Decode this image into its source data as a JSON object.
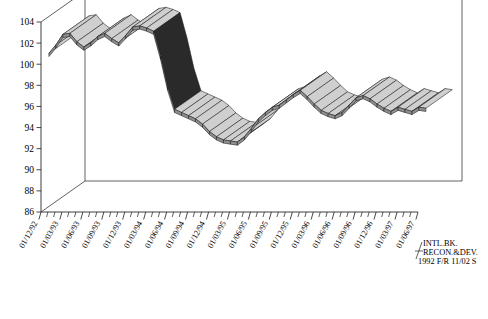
{
  "chart_data": {
    "type": "area",
    "title": "",
    "subtitle": "",
    "xlabel": "",
    "ylabel": "",
    "ylim": [
      86,
      104
    ],
    "ytick_step": 2,
    "grid": false,
    "legend_position": "bottom-right",
    "style": "3d-ribbon",
    "ytick_labels": [
      "104",
      "102",
      "100",
      "98",
      "96",
      "94",
      "92",
      "90",
      "88",
      "86"
    ],
    "ytick_values": [
      104,
      102,
      100,
      98,
      96,
      94,
      92,
      90,
      88,
      86
    ],
    "categories": [
      "01/12/92",
      "01/03/93",
      "01/06/93",
      "01/09/93",
      "01/12/93",
      "01/03/94",
      "01/06/94",
      "01/09/94",
      "01/12/94",
      "01/03/95",
      "01/06/95",
      "01/09/95",
      "01/12/95",
      "01/03/96",
      "01/06/96",
      "01/09/96",
      "01/12/96",
      "01/03/97",
      "01/06/97"
    ],
    "x_minor_ticks_per_category": 3,
    "series": [
      {
        "name": "INTL.BK. RECON.&DEV. 1992 F/R 11/02 S",
        "color": "#cfcfcf",
        "x": [
          "01/12/92",
          "01/01/93",
          "01/02/93",
          "01/03/93",
          "01/04/93",
          "01/05/93",
          "01/06/93",
          "01/07/93",
          "01/08/93",
          "01/09/93",
          "01/10/93",
          "01/11/93",
          "01/12/93",
          "01/01/94",
          "01/02/94",
          "01/03/94",
          "01/04/94",
          "01/05/94",
          "01/06/94",
          "01/07/94",
          "01/08/94",
          "01/09/94",
          "01/10/94",
          "01/11/94",
          "01/12/94",
          "01/01/95",
          "01/02/95",
          "01/03/95",
          "01/04/95",
          "01/05/95",
          "01/06/95",
          "01/07/95",
          "01/08/95",
          "01/09/95",
          "01/10/95",
          "01/11/95",
          "01/12/95",
          "01/01/96",
          "01/02/96",
          "01/03/96",
          "01/04/96",
          "01/05/96",
          "01/06/96",
          "01/07/96",
          "01/08/96",
          "01/09/96",
          "01/10/96",
          "01/11/96",
          "01/12/96",
          "01/01/97",
          "01/02/97",
          "01/03/97",
          "01/04/97",
          "01/05/97",
          "01/06/97"
        ],
        "values": [
          100.5,
          101.3,
          102.3,
          102.4,
          101.6,
          101.1,
          101.5,
          102.1,
          102.4,
          101.9,
          101.5,
          102.2,
          103.0,
          103.1,
          102.9,
          102.6,
          100.2,
          97.3,
          95.2,
          94.9,
          94.6,
          94.3,
          93.8,
          93.1,
          92.6,
          92.3,
          92.2,
          92.1,
          92.6,
          93.4,
          94.3,
          94.9,
          95.4,
          95.6,
          96.1,
          96.6,
          97.0,
          96.4,
          95.7,
          95.1,
          94.8,
          94.6,
          94.9,
          95.6,
          96.3,
          96.5,
          96.2,
          95.7,
          95.3,
          95.0,
          95.4,
          95.2,
          95.0,
          95.4,
          95.3
        ]
      }
    ],
    "annotations": []
  },
  "legend": {
    "line1": "INTL.BK.",
    "line2": "RECON.&DEV.",
    "line3": "1992 F/R 11/02 S"
  }
}
